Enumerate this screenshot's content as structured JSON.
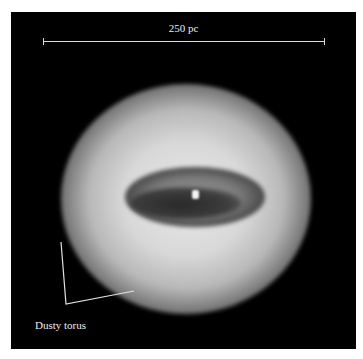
{
  "image": {
    "subject": "Dusty torus around active galactic nucleus",
    "scale_bar": {
      "label": "250 pc"
    },
    "annotations": [
      {
        "label": "Dusty torus"
      }
    ],
    "colors": {
      "background": "#000000",
      "annotation": "#eeeeee"
    }
  }
}
